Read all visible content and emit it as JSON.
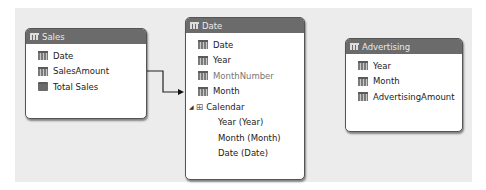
{
  "tables": [
    {
      "name": "Sales",
      "fields": [
        {
          "label": "Date",
          "kind": "column"
        },
        {
          "label": "SalesAmount",
          "kind": "column"
        },
        {
          "label": "Total Sales",
          "kind": "measure"
        }
      ]
    },
    {
      "name": "Date",
      "fields": [
        {
          "label": "Date",
          "kind": "column"
        },
        {
          "label": "Year",
          "kind": "column"
        },
        {
          "label": "MonthNumber",
          "kind": "column-hidden"
        },
        {
          "label": "Month",
          "kind": "column"
        }
      ],
      "hierarchy": {
        "label": "Calendar",
        "levels": [
          "Year (Year)",
          "Month (Month)",
          "Date (Date)"
        ]
      }
    },
    {
      "name": "Advertising",
      "fields": [
        {
          "label": "Year",
          "kind": "column"
        },
        {
          "label": "Month",
          "kind": "column"
        },
        {
          "label": "AdvertisingAmount",
          "kind": "column"
        }
      ]
    }
  ],
  "relationships": [
    {
      "from": "Sales",
      "to": "Date"
    }
  ],
  "icons": {
    "table": "table-icon",
    "column": "column-icon",
    "measure": "measure-icon",
    "hierarchy": "hierarchy-icon",
    "expand": "expand-triangle-icon"
  }
}
